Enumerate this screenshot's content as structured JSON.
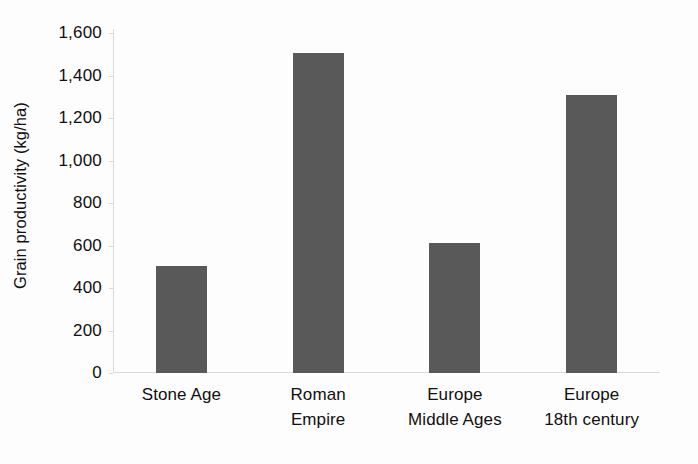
{
  "chart_data": {
    "type": "bar",
    "title": "",
    "subtitle": "",
    "xlabel": "",
    "ylabel": "Grain productivity (kg/ha)",
    "categories": [
      "Stone Age",
      "Roman Empire",
      "Europe Middle Ages",
      "Europe 18th century"
    ],
    "category_lines": [
      [
        "Stone Age",
        ""
      ],
      [
        "Roman",
        "Empire"
      ],
      [
        "Europe",
        "Middle Ages"
      ],
      [
        "Europe",
        "18th century"
      ]
    ],
    "values": [
      505,
      1505,
      610,
      1310
    ],
    "ylim": [
      0,
      1600
    ],
    "ytick_step": 200,
    "ytick_labels": [
      "0",
      "200",
      "400",
      "600",
      "800",
      "1,000",
      "1,200",
      "1,400",
      "1,600"
    ],
    "ytick_values": [
      0,
      200,
      400,
      600,
      800,
      1000,
      1200,
      1400,
      1600
    ],
    "grid": false,
    "legend": false,
    "legend_position": "none",
    "bar_color": "#595959",
    "axis_color": "#d9d9d9",
    "background_color": "#fdfdfd",
    "text_color": "#101010"
  }
}
